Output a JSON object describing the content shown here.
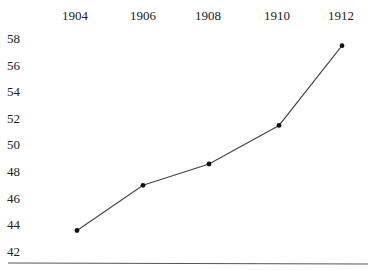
{
  "chart_data": {
    "type": "line",
    "title": "",
    "xlabel": "",
    "ylabel": "",
    "x": [
      1904,
      1906,
      1908,
      1910,
      1912
    ],
    "categories": [
      "1904",
      "1906",
      "1908",
      "1910",
      "1912"
    ],
    "series": [
      {
        "name": "series",
        "values": [
          43.6,
          47.0,
          48.6,
          51.5,
          57.5
        ]
      }
    ],
    "x_tick_labels": [
      "1904",
      "1906",
      "1908",
      "1910",
      "1912"
    ],
    "y_tick_labels": [
      "58",
      "56",
      "54",
      "52",
      "50",
      "48",
      "46",
      "44",
      "42"
    ],
    "ylim": [
      41,
      59
    ],
    "grid": false,
    "legend": null,
    "x_axis_position": "top",
    "baseline": true,
    "colors": {
      "line": "#444444",
      "marker": "#111111",
      "text": "#222222",
      "baseline": "#555555"
    }
  }
}
